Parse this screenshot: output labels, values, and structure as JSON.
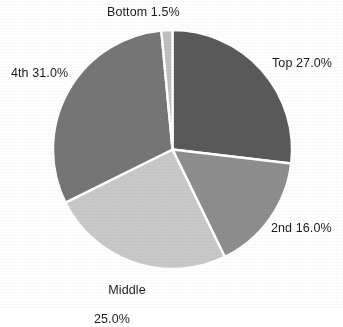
{
  "chart_data": {
    "type": "pie",
    "title": "",
    "xlabel": "",
    "ylabel": "",
    "legend_position": "none",
    "grid": false,
    "start_angle_deg": 0,
    "direction": "clockwise",
    "categories": [
      "Top",
      "2nd",
      "Middle",
      "4th",
      "Bottom"
    ],
    "values": [
      27.0,
      16.0,
      25.0,
      31.0,
      1.5
    ],
    "value_unit": "%",
    "slices": [
      {
        "name": "Top",
        "value": 27.0,
        "label": "Top 27.0%",
        "color": "#5a5a5a",
        "label_position": "right-upper"
      },
      {
        "name": "2nd",
        "value": 16.0,
        "label": "2nd 16.0%",
        "color": "#8e8e8e",
        "label_position": "right-lower"
      },
      {
        "name": "Middle",
        "value": 25.0,
        "label": "Middle\n25.0%",
        "label_line1": "Middle",
        "label_line2": "25.0%",
        "color": "#c9c9c9",
        "label_position": "bottom"
      },
      {
        "name": "4th",
        "value": 31.0,
        "label": "4th 31.0%",
        "color": "#767676",
        "label_position": "left-upper"
      },
      {
        "name": "Bottom",
        "value": 1.5,
        "label": "Bottom 1.5%",
        "color": "#c0c0c0",
        "label_position": "top"
      }
    ],
    "separator_color": "#ffffff",
    "background_color": "#ffffff",
    "text_color": "#1c1c1c"
  },
  "labels": {
    "top": "Top 27.0%",
    "second": "2nd 16.0%",
    "middle_line1": "Middle",
    "middle_line2": "25.0%",
    "fourth": "4th 31.0%",
    "bottom": "Bottom 1.5%"
  }
}
